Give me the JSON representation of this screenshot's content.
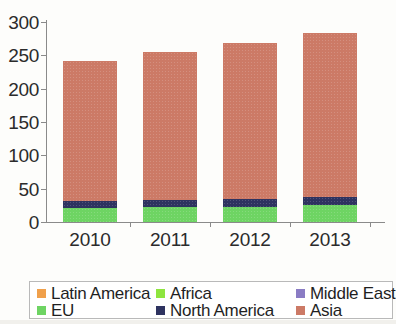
{
  "chart_data": {
    "type": "bar",
    "stacked": true,
    "title": "",
    "subtitle": "",
    "xlabel": "",
    "ylabel": "",
    "categories": [
      "2010",
      "2011",
      "2012",
      "2013"
    ],
    "ylim": [
      0,
      300
    ],
    "yticks": [
      0,
      50,
      100,
      150,
      200,
      250,
      300
    ],
    "ytick_labels": [
      "0",
      "50",
      "100",
      "150",
      "200",
      "250",
      "300"
    ],
    "grid": false,
    "legend_position": "bottom",
    "series": [
      {
        "name": "Latin America",
        "color": "#f0a04b",
        "values": [
          0,
          0,
          0,
          0
        ]
      },
      {
        "name": "Africa",
        "color": "#8ee53f",
        "values": [
          0,
          0,
          0,
          0
        ]
      },
      {
        "name": "Middle East",
        "color": "#8a7cc4",
        "values": [
          0,
          0,
          0,
          0
        ]
      },
      {
        "name": "EU",
        "color": "#6ed463",
        "values": [
          21,
          22,
          23,
          26
        ]
      },
      {
        "name": "North America",
        "color": "#2e3360",
        "values": [
          10,
          11,
          11,
          11
        ]
      },
      {
        "name": "Asia",
        "color": "#cc7a66",
        "values": [
          211,
          222,
          234,
          246
        ]
      }
    ],
    "totals": [
      242,
      255,
      268,
      283
    ]
  },
  "legend": {
    "rows": [
      [
        {
          "label": "Latin America",
          "color": "#f0a04b"
        },
        {
          "label": "Africa",
          "color": "#8ee53f"
        },
        {
          "label": "Middle East",
          "color": "#8a7cc4"
        }
      ],
      [
        {
          "label": "EU",
          "color": "#6ed463"
        },
        {
          "label": "North America",
          "color": "#2e3360"
        },
        {
          "label": "Asia",
          "color": "#cc7a66"
        }
      ]
    ]
  }
}
